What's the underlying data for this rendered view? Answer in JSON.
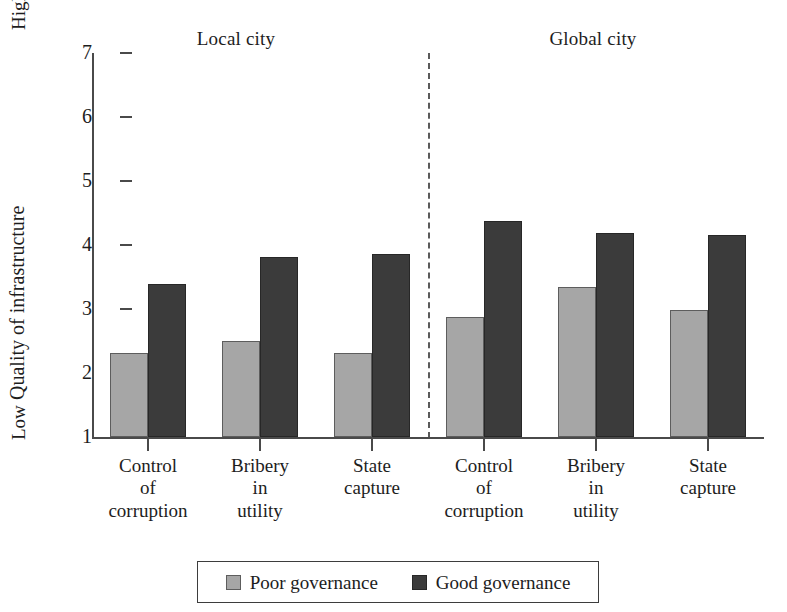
{
  "chart_data": {
    "type": "bar",
    "title": "",
    "xlabel": "",
    "ylabel": "Quality of infrastructure",
    "ylim": [
      1,
      7
    ],
    "yticks": [
      1,
      2,
      3,
      4,
      5,
      6,
      7
    ],
    "ytick_labels": [
      "1",
      "2",
      "3",
      "4",
      "5",
      "6",
      "7"
    ],
    "y_axis_high_label": "High",
    "y_axis_low_label": "Low",
    "grid": false,
    "legend_position": "bottom-center",
    "panels": [
      {
        "name": "Local city",
        "label": "Local city"
      },
      {
        "name": "Global city",
        "label": "Global city"
      }
    ],
    "categories": [
      "Control\nof\ncorruption",
      "Bribery\nin\nutility",
      "State\ncapture",
      "Control\nof\ncorruption",
      "Bribery\nin\nutility",
      "State\ncapture"
    ],
    "series": [
      {
        "name": "Poor governance",
        "color": "#a6a6a6",
        "values": [
          2.32,
          2.5,
          2.31,
          2.87,
          3.35,
          2.98
        ]
      },
      {
        "name": "Good governance",
        "color": "#3b3b3b",
        "values": [
          3.39,
          3.81,
          3.86,
          4.38,
          4.19,
          4.16
        ]
      }
    ],
    "annotations": [
      "dashed vertical divider separating Local city and Global city panels"
    ]
  },
  "legend": {
    "items": [
      {
        "label": "Poor governance",
        "swatch": "poor"
      },
      {
        "label": "Good governance",
        "swatch": "good"
      }
    ]
  }
}
